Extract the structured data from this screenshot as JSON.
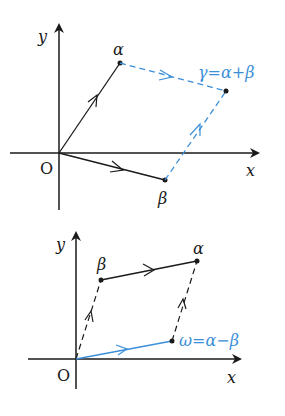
{
  "colors": {
    "black": "#1a1a1a",
    "blue": "#3b8fd9"
  },
  "top_diagram": {
    "axis_x_label": "x",
    "axis_y_label": "y",
    "origin_label": "O",
    "alpha_label": "α",
    "beta_label": "β",
    "gamma_label": "γ=α+β"
  },
  "bottom_diagram": {
    "axis_x_label": "x",
    "axis_y_label": "y",
    "origin_label": "O",
    "alpha_label": "α",
    "beta_label": "β",
    "omega_label": "ω=α−β"
  }
}
